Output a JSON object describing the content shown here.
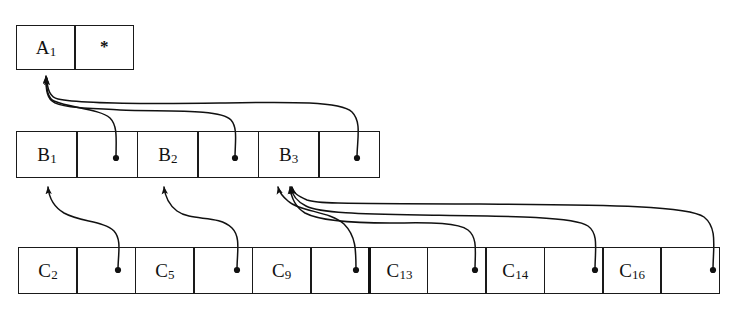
{
  "diagram": {
    "ink_color": "#1a1a1a",
    "background": "#ffffff",
    "levels": [
      {
        "name": "level-a",
        "role": "top-level-index-node",
        "cells": [
          {
            "kind": "key",
            "label": "A",
            "subscript": "1",
            "text": "A1"
          },
          {
            "kind": "marker",
            "label": "*",
            "subscript": "",
            "text": "*"
          }
        ]
      },
      {
        "name": "level-b",
        "role": "middle-level-index-node",
        "cells": [
          {
            "kind": "key",
            "label": "B",
            "subscript": "1",
            "text": "B1"
          },
          {
            "kind": "pointer",
            "label": "",
            "subscript": "",
            "text": ""
          },
          {
            "kind": "key",
            "label": "B",
            "subscript": "2",
            "text": "B2"
          },
          {
            "kind": "pointer",
            "label": "",
            "subscript": "",
            "text": ""
          },
          {
            "kind": "key",
            "label": "B",
            "subscript": "3",
            "text": "B3"
          },
          {
            "kind": "pointer",
            "label": "",
            "subscript": "",
            "text": ""
          }
        ]
      },
      {
        "name": "level-c",
        "role": "leaf-level-index-node",
        "cells": [
          {
            "kind": "key",
            "label": "C",
            "subscript": "2",
            "text": "C2"
          },
          {
            "kind": "pointer",
            "label": "",
            "subscript": "",
            "text": ""
          },
          {
            "kind": "key",
            "label": "C",
            "subscript": "5",
            "text": "C5"
          },
          {
            "kind": "pointer",
            "label": "",
            "subscript": "",
            "text": ""
          },
          {
            "kind": "key",
            "label": "C",
            "subscript": "9",
            "text": "C9"
          },
          {
            "kind": "pointer",
            "label": "",
            "subscript": "",
            "text": ""
          },
          {
            "kind": "key",
            "label": "C",
            "subscript": "13",
            "text": "C13",
            "thick_left_border": true
          },
          {
            "kind": "pointer",
            "label": "",
            "subscript": "",
            "text": ""
          },
          {
            "kind": "key",
            "label": "C",
            "subscript": "14",
            "text": "C14"
          },
          {
            "kind": "pointer",
            "label": "",
            "subscript": "",
            "text": ""
          },
          {
            "kind": "key",
            "label": "C",
            "subscript": "16",
            "text": "C16"
          },
          {
            "kind": "pointer",
            "label": "",
            "subscript": "",
            "text": ""
          }
        ]
      }
    ],
    "links": [
      {
        "name": "b1-ptr-to-a",
        "from_level": "level-b",
        "from_cell": 1,
        "to_level": "level-a",
        "to_cell": 0
      },
      {
        "name": "b2-ptr-to-a",
        "from_level": "level-b",
        "from_cell": 3,
        "to_level": "level-a",
        "to_cell": 0
      },
      {
        "name": "b3-ptr-to-a",
        "from_level": "level-b",
        "from_cell": 5,
        "to_level": "level-a",
        "to_cell": 0
      },
      {
        "name": "c2-ptr-to-b1",
        "from_level": "level-c",
        "from_cell": 1,
        "to_level": "level-b",
        "to_cell": 0
      },
      {
        "name": "c5-ptr-to-b2",
        "from_level": "level-c",
        "from_cell": 3,
        "to_level": "level-b",
        "to_cell": 2
      },
      {
        "name": "c9-ptr-to-b3",
        "from_level": "level-c",
        "from_cell": 5,
        "to_level": "level-b",
        "to_cell": 4
      },
      {
        "name": "c13-ptr-to-b3",
        "from_level": "level-c",
        "from_cell": 7,
        "to_level": "level-b",
        "to_cell": 4
      },
      {
        "name": "c14-ptr-to-b3",
        "from_level": "level-c",
        "from_cell": 9,
        "to_level": "level-b",
        "to_cell": 4
      },
      {
        "name": "c16-ptr-to-b3",
        "from_level": "level-c",
        "from_cell": 11,
        "to_level": "level-b",
        "to_cell": 4
      }
    ]
  }
}
